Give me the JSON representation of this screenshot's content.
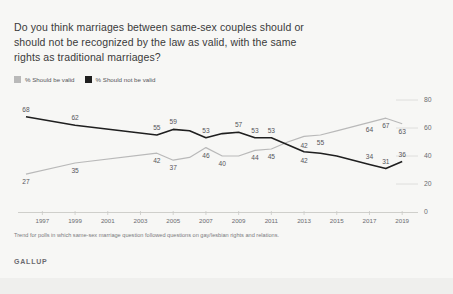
{
  "card": {
    "title": "Do you think marriages between same-sex couples should or should not be recognized by the law as valid, with the same rights as traditional marriages?",
    "footnote": "Trend for polls in which same-sex marriage question followed questions on gay/lesbian rights and relations.",
    "brand": "GALLUP"
  },
  "legend": {
    "items": [
      {
        "label": "% Should be valid",
        "color": "#b9b9b9",
        "name": "legend-swatch-valid"
      },
      {
        "label": "% Should not be valid",
        "color": "#1f1f1f",
        "name": "legend-swatch-not-valid"
      }
    ]
  },
  "chart_data": {
    "type": "line",
    "title": "Do you think marriages between same-sex couples should or should not be recognized by the law as valid, with the same rights as traditional marriages?",
    "xlabel": "",
    "ylabel": "",
    "ylim": [
      0,
      80
    ],
    "yticks": [
      "0",
      "20",
      "40",
      "60",
      "80"
    ],
    "grid": false,
    "legend_position": "top-left",
    "xticks": [
      "1997",
      "1999",
      "2001",
      "2003",
      "2005",
      "2007",
      "2009",
      "2011",
      "2013",
      "2015",
      "2017",
      "2019"
    ],
    "x": [
      1996,
      1999,
      2004,
      2005,
      2006,
      2007,
      2008,
      2009,
      2010,
      2011,
      2012,
      2013,
      2014,
      2015,
      2016,
      2017,
      2018,
      2019
    ],
    "series": [
      {
        "name": "% Should be valid",
        "color": "#b9b9b9",
        "values": [
          27,
          35,
          42,
          37,
          39,
          46,
          40,
          40,
          44,
          45,
          50,
          54,
          55,
          58,
          61,
          64,
          67,
          63
        ],
        "labels": [
          {
            "x": 1996,
            "y": 27,
            "text": "27"
          },
          {
            "x": 1999,
            "y": 35,
            "text": "35"
          },
          {
            "x": 2004,
            "y": 42,
            "text": "42"
          },
          {
            "x": 2005,
            "y": 37,
            "text": "37"
          },
          {
            "x": 2007,
            "y": 46,
            "text": "46"
          },
          {
            "x": 2008,
            "y": 40,
            "text": "40"
          },
          {
            "x": 2010,
            "y": 44,
            "text": "44"
          },
          {
            "x": 2011,
            "y": 45,
            "text": "45"
          },
          {
            "x": 2013,
            "y": 42,
            "text": "42"
          },
          {
            "x": 2014,
            "y": 55,
            "text": "55"
          },
          {
            "x": 2017,
            "y": 64,
            "text": "64"
          },
          {
            "x": 2018,
            "y": 67,
            "text": "67"
          },
          {
            "x": 2019,
            "y": 63,
            "text": "63"
          }
        ]
      },
      {
        "name": "% Should not be valid",
        "color": "#1f1f1f",
        "values": [
          68,
          62,
          55,
          59,
          58,
          53,
          56,
          57,
          53,
          53,
          48,
          43,
          42,
          40,
          37,
          34,
          31,
          36
        ],
        "labels": [
          {
            "x": 1996,
            "y": 68,
            "text": "68"
          },
          {
            "x": 1999,
            "y": 62,
            "text": "62"
          },
          {
            "x": 2004,
            "y": 55,
            "text": "55"
          },
          {
            "x": 2005,
            "y": 59,
            "text": "59"
          },
          {
            "x": 2007,
            "y": 53,
            "text": "53"
          },
          {
            "x": 2009,
            "y": 57,
            "text": "57"
          },
          {
            "x": 2010,
            "y": 53,
            "text": "53"
          },
          {
            "x": 2011,
            "y": 53,
            "text": "53"
          },
          {
            "x": 2013,
            "y": 42,
            "text": "42"
          },
          {
            "x": 2017,
            "y": 34,
            "text": "34"
          },
          {
            "x": 2018,
            "y": 31,
            "text": "31"
          },
          {
            "x": 2019,
            "y": 36,
            "text": "36"
          }
        ]
      }
    ]
  }
}
